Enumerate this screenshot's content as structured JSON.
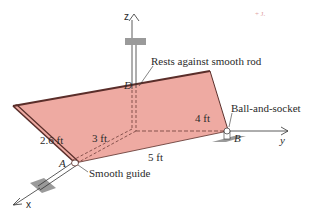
{
  "diagram": {
    "colors": {
      "plate_fill": "#eeaaa2",
      "plate_edge": "#5a2e2a",
      "support_gray": "#9a9a9a",
      "line": "#333333"
    },
    "axes": {
      "x": "x",
      "y": "y",
      "z": "z"
    },
    "points": {
      "A": "A",
      "B": "B",
      "D": "D"
    },
    "dimensions": {
      "height_left": "2.6 ft",
      "diag_AO": "3 ft",
      "OB": "4 ft",
      "AB": "5 ft"
    },
    "annotations": {
      "rod": "Rests against smooth rod",
      "ball_socket": "Ball-and-socket",
      "guide": "Smooth guide"
    },
    "corner_mark": "+ J."
  }
}
